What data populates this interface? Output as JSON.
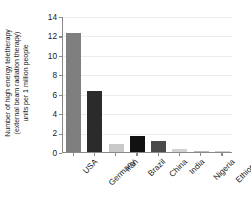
{
  "chart_data": {
    "type": "bar",
    "title": "",
    "subtitle": "",
    "xlabel": "",
    "ylabel_lines": [
      "Number of high energy teletherapy",
      "(external beam radiation therapy)",
      "units per 1 million people"
    ],
    "ylabel": "Number of high energy teletherapy (external beam radiation therapy) units per 1 million people",
    "categories": [
      "USA",
      "Germany",
      "Iran",
      "Brazil",
      "China",
      "India",
      "Nigeria",
      "Ethiopia"
    ],
    "values": [
      12.3,
      6.3,
      0.85,
      1.7,
      1.1,
      0.35,
      0.1,
      0.02
    ],
    "bar_colors": [
      "#7f7f7f",
      "#2b2b2b",
      "#c9c9c9",
      "#111111",
      "#4a4a4a",
      "#d2d2d2",
      "#b9b9b9",
      "#cfcfcf"
    ],
    "ylim": [
      0,
      14
    ],
    "ytick_labels": [
      "0",
      "2",
      "4",
      "6",
      "8",
      "10",
      "12",
      "14"
    ],
    "ytick_values": [
      0,
      2,
      4,
      6,
      8,
      10,
      12,
      14
    ],
    "grid": true,
    "grid_axis": "y",
    "grid_color": "#ececec",
    "legend": false,
    "legend_position": "none",
    "axis_color": "#8a8a8a",
    "background": "#ffffff",
    "xtick_label_rotation": -45
  }
}
